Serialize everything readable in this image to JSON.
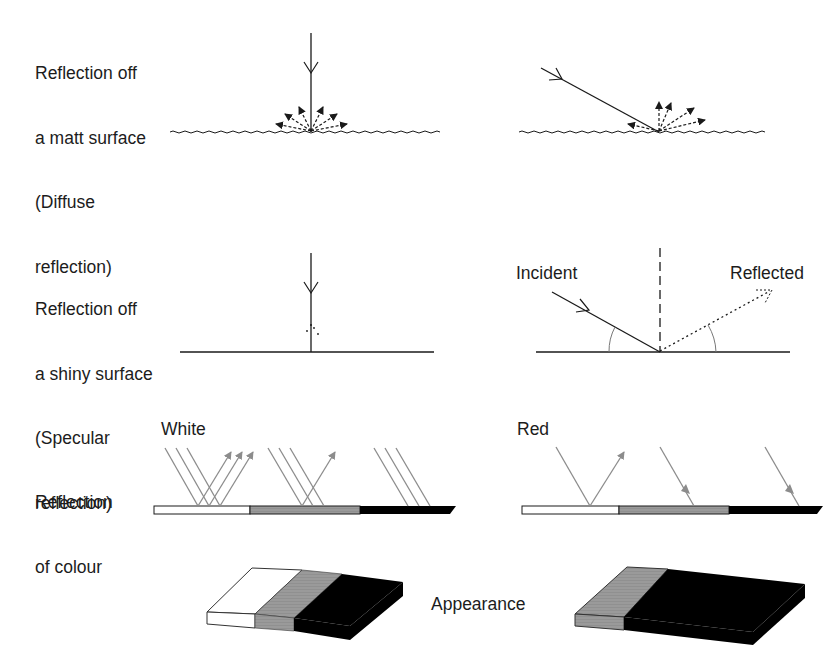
{
  "rows": {
    "matt": {
      "label_lines": [
        "Reflection off",
        "a matt surface",
        "(Diffuse",
        "reflection)"
      ],
      "type": "diffuse"
    },
    "shiny": {
      "label_lines": [
        "Reflection off",
        "a shiny surface",
        "(Specular",
        "reflection)"
      ],
      "type": "specular",
      "incident_label": "Incident",
      "reflected_label": "Reflected"
    },
    "colour": {
      "label_lines": [
        "Reflection",
        "of colour"
      ],
      "white_light_label": "White",
      "red_light_label": "Red",
      "strip_segments": [
        "white",
        "grey",
        "black"
      ]
    },
    "appearance": {
      "label": "Appearance",
      "under_white": [
        "white",
        "grey",
        "black"
      ],
      "under_red": [
        "grey",
        "black"
      ]
    }
  },
  "colors": {
    "ink": "#1a1a1a",
    "ray_grey": "#8c8c8c",
    "grey_surface": "#9a9a9a",
    "black_surface": "#000000",
    "white_surface": "#ffffff"
  }
}
